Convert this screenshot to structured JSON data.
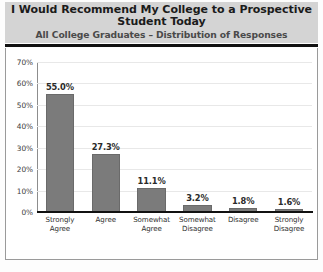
{
  "header": {
    "title": "I Would Recommend My College to a Prospective Student Today",
    "subtitle": "All College Graduates – Distribution of Responses"
  },
  "colors": {
    "bar": "#7b7b7b",
    "bar_border": "#6a6a6a",
    "header_background": "#d4d4d4",
    "header_rule": "#111111",
    "gridline": "#e8e8e8",
    "axis": "#111111",
    "plot_background": "#ffffff",
    "title_text": "#1b1b1b",
    "subtitle_text": "#4a4a4a"
  },
  "chart_data": {
    "type": "bar",
    "title": "I Would Recommend My College to a Prospective Student Today",
    "subtitle": "All College Graduates – Distribution of Responses",
    "xlabel": "",
    "ylabel": "",
    "ylim": [
      0,
      70
    ],
    "yticks": [
      0,
      10,
      20,
      30,
      40,
      50,
      60,
      70
    ],
    "ytick_labels": [
      "0%",
      "10%",
      "20%",
      "30%",
      "40%",
      "50%",
      "60%",
      "70%"
    ],
    "grid": true,
    "legend": false,
    "categories": [
      "Strongly Agree",
      "Agree",
      "Somewhat Agree",
      "Somewhat Disagree",
      "Disagree",
      "Strongly Disagree"
    ],
    "category_lines": [
      [
        "Strongly",
        "Agree"
      ],
      [
        "Agree",
        ""
      ],
      [
        "Somewhat",
        "Agree"
      ],
      [
        "Somewhat",
        "Disagree"
      ],
      [
        "Disagree",
        ""
      ],
      [
        "Strongly",
        "Disagree"
      ]
    ],
    "values": [
      55.0,
      27.3,
      11.1,
      3.2,
      1.8,
      1.6
    ],
    "data_labels": [
      "55.0%",
      "27.3%",
      "11.1%",
      "3.2%",
      "1.8%",
      "1.6%"
    ]
  }
}
